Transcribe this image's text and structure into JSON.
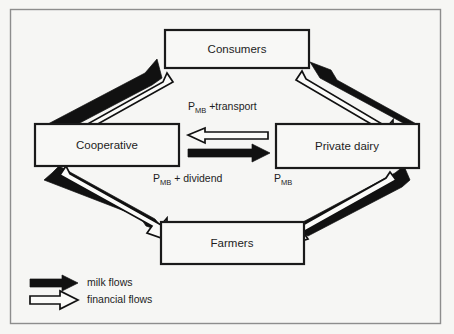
{
  "figure": {
    "kind": "flow-diagram",
    "background_color": "#f6f6f4",
    "line_color": "#111111",
    "frame": {
      "x": 10,
      "y": 9,
      "width": 431,
      "height": 315
    }
  },
  "nodes": [
    {
      "id": "consumers",
      "label": "Consumers",
      "x": 165,
      "y": 30,
      "width": 144,
      "height": 38
    },
    {
      "id": "cooperative",
      "label": "Cooperative",
      "x": 35,
      "y": 124,
      "width": 144,
      "height": 42
    },
    {
      "id": "private_dairy",
      "label": "Private dairy",
      "x": 276,
      "y": 124,
      "width": 143,
      "height": 44
    },
    {
      "id": "farmers",
      "label": "Farmers",
      "x": 161,
      "y": 222,
      "width": 143,
      "height": 42
    }
  ],
  "flow_labels": [
    {
      "id": "label_transport",
      "base": "P",
      "sub": "MB",
      "rest": " +transport",
      "x": 188,
      "y": 110
    },
    {
      "id": "label_dividend",
      "base": "P",
      "sub": "MB",
      "rest": " + dividend",
      "x": 153,
      "y": 182
    },
    {
      "id": "label_pmb",
      "base": "P",
      "sub": "MB",
      "rest": "",
      "x": 274,
      "y": 182
    }
  ],
  "edges": [
    {
      "id": "cooperative-to-consumers",
      "type": "milk",
      "from": "cooperative",
      "to": "consumers"
    },
    {
      "id": "consumers-to-cooperative",
      "type": "financial",
      "from": "consumers",
      "to": "cooperative"
    },
    {
      "id": "private-dairy-to-consumers",
      "type": "milk",
      "from": "private_dairy",
      "to": "consumers"
    },
    {
      "id": "consumers-to-private-dairy",
      "type": "financial",
      "from": "consumers",
      "to": "private_dairy"
    },
    {
      "id": "cooperative-to-private-dairy",
      "type": "milk",
      "from": "cooperative",
      "to": "private_dairy"
    },
    {
      "id": "private-dairy-to-cooperative",
      "type": "financial",
      "from": "private_dairy",
      "to": "cooperative"
    },
    {
      "id": "farmers-to-cooperative",
      "type": "milk",
      "from": "farmers",
      "to": "cooperative"
    },
    {
      "id": "cooperative-to-farmers",
      "type": "financial",
      "from": "cooperative",
      "to": "farmers"
    },
    {
      "id": "farmers-to-private-dairy",
      "type": "milk",
      "from": "farmers",
      "to": "private_dairy"
    },
    {
      "id": "private-dairy-to-farmers",
      "type": "financial",
      "from": "private_dairy",
      "to": "farmers"
    }
  ],
  "legend": {
    "items": [
      {
        "id": "milk",
        "label": "milk flows",
        "swatch": "solid-black-arrow",
        "color": "#111111"
      },
      {
        "id": "financial",
        "label": "financial flows",
        "swatch": "hollow-white-arrow",
        "color": "#fbfbf9"
      }
    ]
  }
}
